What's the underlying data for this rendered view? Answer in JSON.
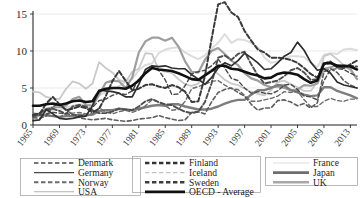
{
  "chart_data": {
    "type": "line",
    "title": "",
    "xlabel": "",
    "ylabel": "",
    "xlim": [
      1965,
      2014
    ],
    "ylim": [
      0,
      15
    ],
    "yticks": [
      0,
      5,
      10,
      15
    ],
    "xticks": [
      1965,
      1969,
      1973,
      1977,
      1981,
      1985,
      1989,
      1993,
      1997,
      2001,
      2005,
      2009,
      2013
    ],
    "grid": true,
    "legend_position": "bottom",
    "x": [
      1965,
      1966,
      1967,
      1968,
      1969,
      1970,
      1971,
      1972,
      1973,
      1974,
      1975,
      1976,
      1977,
      1978,
      1979,
      1980,
      1981,
      1982,
      1983,
      1984,
      1985,
      1986,
      1987,
      1988,
      1989,
      1990,
      1991,
      1992,
      1993,
      1994,
      1995,
      1996,
      1997,
      1998,
      1999,
      2000,
      2001,
      2002,
      2003,
      2004,
      2005,
      2006,
      2007,
      2008,
      2009,
      2010,
      2011,
      2012,
      2013,
      2014
    ],
    "series": [
      {
        "name": "Denmark",
        "style": "dashed",
        "color": "#4a4a4a",
        "width": 1.4,
        "values": [
          1.2,
          1.3,
          1.5,
          1.7,
          1.6,
          1.5,
          1.4,
          1.3,
          1.2,
          2.4,
          3.3,
          3.5,
          4.0,
          4.3,
          4.1,
          4.6,
          6.2,
          7.1,
          7.8,
          7.4,
          6.1,
          4.1,
          4.2,
          5.3,
          6.9,
          7.2,
          7.4,
          8.0,
          8.9,
          7.7,
          6.3,
          6.0,
          5.0,
          4.3,
          4.5,
          4.3,
          4.2,
          4.6,
          5.4,
          5.5,
          4.8,
          3.9,
          3.8,
          3.4,
          6.0,
          7.5,
          7.6,
          7.5,
          7.0,
          6.6
        ]
      },
      {
        "name": "Germany",
        "style": "solid",
        "color": "#2e2e2e",
        "width": 1.7,
        "values": [
          0.6,
          0.7,
          2.1,
          1.5,
          0.9,
          0.8,
          0.9,
          1.1,
          1.2,
          2.6,
          4.7,
          4.6,
          4.5,
          4.3,
          3.8,
          3.8,
          5.5,
          7.5,
          8.0,
          7.9,
          8.0,
          7.7,
          7.6,
          7.6,
          6.8,
          6.2,
          5.5,
          6.4,
          7.7,
          8.4,
          8.0,
          8.7,
          9.7,
          9.1,
          8.4,
          7.5,
          7.6,
          8.4,
          9.3,
          9.8,
          11.2,
          10.1,
          8.5,
          7.4,
          7.6,
          7.0,
          5.8,
          5.4,
          5.2,
          5.0
        ]
      },
      {
        "name": "Norway",
        "style": "dashed",
        "color": "#6a6a6a",
        "width": 1.4,
        "values": [
          1.6,
          1.5,
          1.4,
          1.2,
          1.0,
          1.6,
          1.6,
          1.7,
          1.5,
          1.5,
          2.3,
          1.8,
          1.5,
          1.8,
          2.0,
          1.7,
          2.0,
          2.6,
          3.4,
          3.1,
          2.6,
          2.0,
          2.1,
          3.2,
          4.9,
          5.2,
          5.5,
          5.9,
          6.0,
          5.4,
          4.9,
          4.8,
          4.0,
          3.2,
          3.2,
          3.4,
          3.6,
          3.9,
          4.5,
          4.4,
          4.6,
          3.4,
          2.5,
          2.5,
          3.2,
          3.6,
          3.3,
          3.2,
          3.5,
          3.5
        ]
      },
      {
        "name": "USA",
        "style": "solid",
        "color": "#c9c9c9",
        "width": 1.8,
        "values": [
          4.5,
          4.4,
          3.8,
          3.6,
          3.5,
          4.9,
          5.9,
          5.6,
          4.9,
          5.6,
          8.5,
          7.7,
          7.1,
          6.1,
          5.8,
          7.2,
          7.6,
          9.7,
          9.6,
          7.5,
          7.2,
          7.0,
          6.2,
          5.5,
          5.3,
          5.6,
          6.8,
          7.5,
          6.9,
          6.1,
          5.6,
          5.4,
          4.9,
          4.5,
          4.2,
          4.0,
          4.7,
          5.8,
          6.0,
          5.5,
          5.1,
          4.6,
          4.6,
          5.8,
          9.3,
          9.6,
          8.9,
          8.1,
          7.4,
          6.2
        ]
      },
      {
        "name": "Finland",
        "style": "dashed-bold",
        "color": "#3a3a3a",
        "width": 2.0,
        "values": [
          1.4,
          1.5,
          2.9,
          3.8,
          2.8,
          2.0,
          2.2,
          2.5,
          2.3,
          1.7,
          2.2,
          3.9,
          5.9,
          7.3,
          6.0,
          4.7,
          4.9,
          5.4,
          5.5,
          5.2,
          5.0,
          5.4,
          5.1,
          4.5,
          3.1,
          3.2,
          6.6,
          11.6,
          16.3,
          16.6,
          15.2,
          14.6,
          12.7,
          11.4,
          10.2,
          9.8,
          9.1,
          9.1,
          9.0,
          8.8,
          8.4,
          7.7,
          6.9,
          6.4,
          8.2,
          8.4,
          7.8,
          7.7,
          8.2,
          8.7
        ]
      },
      {
        "name": "Iceland",
        "style": "dashed",
        "color": "#5e5e5e",
        "width": 1.6,
        "values": [
          1.0,
          0.9,
          1.2,
          2.5,
          2.9,
          2.1,
          1.4,
          1.0,
          0.8,
          0.7,
          0.8,
          0.9,
          0.7,
          0.6,
          0.5,
          0.6,
          0.8,
          0.9,
          1.0,
          1.3,
          1.0,
          0.8,
          0.6,
          0.7,
          1.7,
          1.8,
          1.5,
          3.1,
          4.4,
          4.8,
          5.0,
          4.4,
          3.9,
          2.8,
          2.0,
          2.3,
          2.3,
          3.3,
          3.4,
          3.1,
          2.6,
          2.9,
          2.3,
          3.0,
          7.2,
          7.6,
          7.1,
          6.0,
          5.4,
          5.0
        ]
      },
      {
        "name": "Sweden",
        "style": "dashed-bold",
        "color": "#4e4e4e",
        "width": 1.9,
        "values": [
          1.2,
          1.6,
          2.1,
          2.2,
          1.9,
          1.5,
          2.5,
          2.7,
          2.5,
          2.0,
          1.6,
          1.6,
          1.8,
          2.2,
          2.1,
          2.0,
          2.5,
          3.2,
          3.5,
          3.1,
          2.8,
          2.7,
          2.2,
          1.8,
          1.6,
          1.8,
          3.1,
          5.6,
          9.1,
          9.4,
          8.8,
          9.6,
          9.9,
          8.2,
          6.7,
          5.6,
          5.8,
          6.0,
          6.6,
          7.4,
          7.7,
          7.1,
          6.1,
          6.2,
          8.3,
          8.6,
          7.8,
          8.0,
          8.0,
          7.9
        ]
      },
      {
        "name": "OECD - Average",
        "style": "solid-bold",
        "color": "#111111",
        "width": 2.6,
        "values": [
          2.6,
          2.6,
          2.8,
          2.9,
          2.7,
          2.9,
          3.2,
          3.3,
          3.1,
          3.2,
          4.6,
          4.9,
          5.0,
          5.0,
          4.9,
          5.3,
          6.0,
          7.0,
          7.7,
          7.5,
          7.4,
          7.3,
          7.0,
          6.6,
          6.2,
          6.1,
          6.7,
          7.3,
          8.0,
          8.0,
          7.6,
          7.5,
          7.2,
          6.9,
          6.7,
          6.3,
          6.4,
          6.9,
          7.1,
          7.0,
          6.8,
          6.2,
          5.7,
          6.0,
          8.3,
          8.4,
          8.0,
          8.0,
          7.9,
          7.5
        ]
      },
      {
        "name": "France",
        "style": "solid",
        "color": "#dcdcdc",
        "width": 2.0,
        "values": [
          1.5,
          1.6,
          1.8,
          2.0,
          2.1,
          2.3,
          2.6,
          2.8,
          2.7,
          2.8,
          4.0,
          4.4,
          4.9,
          5.2,
          5.9,
          6.2,
          7.4,
          8.1,
          8.3,
          9.7,
          10.2,
          10.4,
          10.5,
          9.8,
          9.3,
          8.9,
          9.4,
          10.3,
          11.1,
          12.3,
          11.1,
          11.6,
          11.5,
          11.1,
          10.5,
          9.1,
          8.4,
          8.6,
          9.0,
          9.3,
          9.3,
          9.2,
          8.4,
          7.8,
          9.5,
          9.7,
          9.6,
          10.2,
          10.3,
          10.1
        ]
      },
      {
        "name": "Japan",
        "style": "solid",
        "color": "#7d7d7d",
        "width": 2.4,
        "values": [
          1.2,
          1.3,
          1.3,
          1.2,
          1.1,
          1.2,
          1.2,
          1.4,
          1.3,
          1.4,
          1.9,
          2.0,
          2.0,
          2.2,
          2.1,
          2.0,
          2.2,
          2.4,
          2.6,
          2.7,
          2.6,
          2.8,
          2.8,
          2.5,
          2.3,
          2.1,
          2.1,
          2.2,
          2.5,
          2.9,
          3.2,
          3.4,
          3.4,
          4.1,
          4.7,
          4.7,
          5.0,
          5.4,
          5.3,
          4.7,
          4.4,
          4.1,
          3.9,
          4.0,
          5.1,
          5.1,
          4.6,
          4.3,
          4.0,
          3.6
        ]
      },
      {
        "name": "UK",
        "style": "solid",
        "color": "#9e9e9e",
        "width": 2.2,
        "values": [
          1.4,
          1.5,
          2.2,
          2.4,
          2.4,
          2.6,
          3.5,
          3.8,
          2.7,
          2.6,
          4.1,
          5.7,
          6.0,
          5.9,
          5.0,
          6.4,
          9.8,
          11.3,
          11.8,
          11.8,
          11.4,
          11.8,
          10.6,
          8.6,
          7.2,
          7.1,
          8.8,
          10.0,
          10.4,
          9.6,
          8.7,
          8.1,
          7.0,
          6.3,
          6.0,
          5.4,
          5.1,
          5.2,
          5.0,
          4.7,
          4.8,
          5.4,
          5.3,
          5.6,
          7.6,
          7.8,
          8.1,
          7.9,
          7.6,
          6.2
        ]
      }
    ]
  },
  "axes": {
    "ytick_labels": [
      "0",
      "5",
      "10",
      "15"
    ],
    "xtick_labels": [
      "1965",
      "1969",
      "1973",
      "1977",
      "1981",
      "1985",
      "1989",
      "1993",
      "1997",
      "2001",
      "2005",
      "2009",
      "2013"
    ]
  },
  "legend": {
    "columns": [
      {
        "entries": [
          {
            "label": "Denmark",
            "style": "dashed",
            "color": "#4a4a4a",
            "width": 1.6
          },
          {
            "label": "Germany",
            "style": "solid",
            "color": "#4a4a4a",
            "width": 1.4
          },
          {
            "label": "Norway",
            "style": "dashed",
            "color": "#6a6a6a",
            "width": 2.0
          },
          {
            "label": "USA",
            "style": "solid",
            "color": "#b0b0b0",
            "width": 1.1
          }
        ]
      },
      {
        "entries": [
          {
            "label": "Finland",
            "style": "dashed",
            "color": "#333333",
            "width": 2.4
          },
          {
            "label": "Iceland",
            "style": "dashed",
            "color": "#c2c2c2",
            "width": 1.4
          },
          {
            "label": "Sweden",
            "style": "dashed",
            "color": "#3d3d3d",
            "width": 2.4
          },
          {
            "label": "OECD - Average",
            "style": "solid",
            "color": "#111111",
            "width": 2.8
          }
        ]
      },
      {
        "entries": [
          {
            "label": "France",
            "style": "solid",
            "color": "#e8e8e8",
            "width": 1.6
          },
          {
            "label": "Japan",
            "style": "solid",
            "color": "#6e6e6e",
            "width": 2.6
          },
          {
            "label": "UK",
            "style": "solid",
            "color": "#a8a8a8",
            "width": 2.4
          }
        ]
      }
    ]
  }
}
